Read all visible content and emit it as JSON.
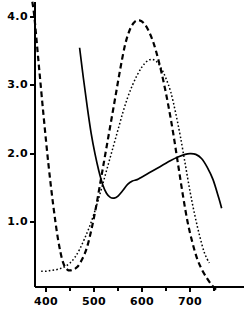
{
  "chart_data": {
    "type": "line",
    "title": "",
    "subtitle": "",
    "xlabel": "",
    "ylabel": "",
    "xlim": [
      355,
      770
    ],
    "ylim": [
      0,
      4.35
    ],
    "grid": false,
    "legend_position": "none",
    "x_major_ticks": [
      400,
      500,
      600,
      700
    ],
    "x_minor_ticks": [
      450,
      550,
      650,
      750
    ],
    "x_tick_labels": [
      "400",
      "500",
      "600",
      "700"
    ],
    "y_major_ticks": [
      1.0,
      2.0,
      3.0,
      4.0
    ],
    "y_tick_labels": [
      "1.0",
      "2.0",
      "3.0",
      "4.0"
    ],
    "axis_color": "#000000",
    "series": [
      {
        "name": "dashed-curve",
        "style": "dashed",
        "color": "#000000",
        "x": [
          368,
          375,
          385,
          395,
          405,
          415,
          425,
          435,
          445,
          455,
          465,
          475,
          485,
          495,
          505,
          515,
          525,
          535,
          545,
          555,
          565,
          575,
          585,
          595,
          605,
          615,
          625,
          635,
          645,
          655,
          665,
          675,
          685,
          695,
          705,
          715,
          725,
          735,
          745,
          755
        ],
        "y": [
          4.35,
          4.05,
          3.3,
          2.55,
          1.85,
          1.25,
          0.75,
          0.42,
          0.3,
          0.3,
          0.34,
          0.45,
          0.62,
          0.9,
          1.25,
          1.65,
          2.05,
          2.45,
          2.85,
          3.25,
          3.6,
          3.82,
          3.93,
          3.95,
          3.9,
          3.78,
          3.6,
          3.35,
          3.05,
          2.7,
          2.3,
          1.85,
          1.4,
          1.0,
          0.7,
          0.46,
          0.3,
          0.18,
          0.08,
          0.0
        ]
      },
      {
        "name": "dotted-curve",
        "style": "dotted",
        "color": "#000000",
        "x": [
          390,
          400,
          410,
          420,
          430,
          440,
          450,
          460,
          470,
          480,
          490,
          500,
          510,
          520,
          530,
          540,
          550,
          560,
          570,
          580,
          590,
          600,
          610,
          620,
          630,
          640,
          650,
          660,
          670,
          680,
          690,
          700,
          710,
          720,
          730,
          740
        ],
        "y": [
          0.28,
          0.28,
          0.29,
          0.3,
          0.32,
          0.35,
          0.4,
          0.48,
          0.6,
          0.75,
          0.92,
          1.12,
          1.35,
          1.6,
          1.85,
          2.1,
          2.35,
          2.6,
          2.82,
          3.0,
          3.15,
          3.27,
          3.35,
          3.38,
          3.35,
          3.25,
          3.1,
          2.9,
          2.6,
          2.25,
          1.85,
          1.45,
          1.1,
          0.8,
          0.55,
          0.4
        ]
      },
      {
        "name": "solid-curve",
        "style": "solid",
        "color": "#000000",
        "x": [
          470,
          478,
          486,
          494,
          502,
          510,
          518,
          526,
          534,
          542,
          550,
          560,
          570,
          580,
          590,
          600,
          615,
          630,
          645,
          660,
          675,
          690,
          700,
          712,
          724,
          736,
          748,
          760,
          766
        ],
        "y": [
          3.55,
          3.1,
          2.68,
          2.3,
          2.0,
          1.75,
          1.55,
          1.42,
          1.36,
          1.35,
          1.38,
          1.46,
          1.55,
          1.6,
          1.62,
          1.66,
          1.72,
          1.78,
          1.84,
          1.9,
          1.95,
          1.99,
          2.0,
          1.99,
          1.93,
          1.8,
          1.62,
          1.35,
          1.2
        ]
      }
    ]
  }
}
